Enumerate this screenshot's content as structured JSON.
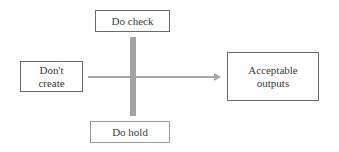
{
  "diagram": {
    "nodes": {
      "start": {
        "label_line1": "Don't",
        "label_line2": "create"
      },
      "top": {
        "label": "Do check"
      },
      "bottom": {
        "label": "Do hold"
      },
      "end": {
        "label_line1": "Acceptable",
        "label_line2": "outputs"
      }
    },
    "edges": [
      {
        "from": "start",
        "to": "end",
        "type": "arrow"
      }
    ],
    "colors": {
      "arrow": "#9e9e9e",
      "bar": "#a0a0a0",
      "border": "#6a6a6a"
    }
  }
}
